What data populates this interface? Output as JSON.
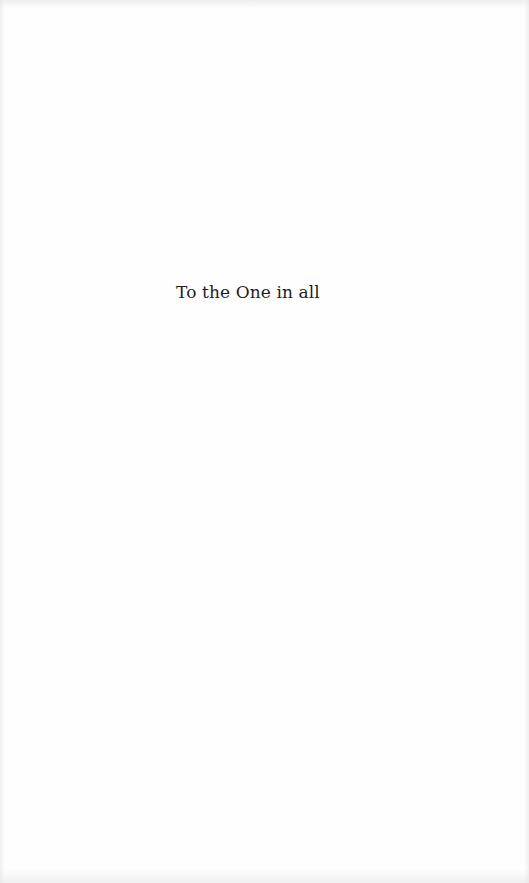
{
  "page": {
    "dedication": "To the One in all"
  }
}
